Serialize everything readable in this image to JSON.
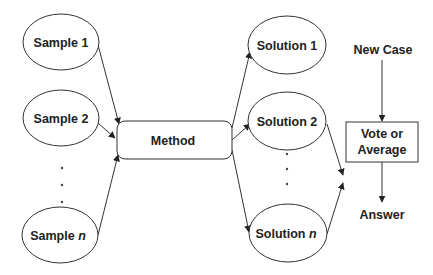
{
  "diagram": {
    "samples": [
      {
        "label": "Sample 1",
        "italic": ""
      },
      {
        "label": "Sample 2",
        "italic": ""
      },
      {
        "label": "Sample ",
        "italic": "n"
      }
    ],
    "method": {
      "label": "Method"
    },
    "solutions": [
      {
        "label": "Solution 1",
        "italic": ""
      },
      {
        "label": "Solution 2",
        "italic": ""
      },
      {
        "label": "Solution ",
        "italic": "n"
      }
    ],
    "new_case": {
      "label": "New Case"
    },
    "vote": {
      "line1": "Vote or",
      "line2": "Average"
    },
    "answer": {
      "label": "Answer"
    },
    "ellipsis": "⋮",
    "edges": [
      {
        "from": "Sample 1",
        "to": "Method"
      },
      {
        "from": "Sample 2",
        "to": "Method"
      },
      {
        "from": "Sample n",
        "to": "Method"
      },
      {
        "from": "Method",
        "to": "Solution 1"
      },
      {
        "from": "Method",
        "to": "Solution 2"
      },
      {
        "from": "Method",
        "to": "Solution n"
      },
      {
        "from": "Solution 2",
        "to": "Vote or Average"
      },
      {
        "from": "Solution n",
        "to": "Vote or Average"
      },
      {
        "from": "New Case",
        "to": "Vote or Average"
      },
      {
        "from": "Vote or Average",
        "to": "Answer"
      }
    ]
  }
}
